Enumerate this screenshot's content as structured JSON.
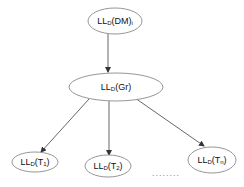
{
  "diagram": {
    "type": "tree",
    "nodes": [
      {
        "id": "root",
        "label_main": "LL",
        "label_sub": "D",
        "label_rest": "(DM)",
        "label_sub2": "i"
      },
      {
        "id": "mid",
        "label_main": "LL",
        "label_sub": "D",
        "label_rest": "(Gr)",
        "label_sub2": ""
      },
      {
        "id": "t1",
        "label_main": "LL",
        "label_sub": "D",
        "label_rest": "(T",
        "label_sub2": "1",
        "label_close": ")"
      },
      {
        "id": "t2",
        "label_main": "LL",
        "label_sub": "D",
        "label_rest": "(T",
        "label_sub2": "2",
        "label_close": ")"
      },
      {
        "id": "tn",
        "label_main": "LL",
        "label_sub": "D",
        "label_rest": "(T",
        "label_sub2": "n",
        "label_close": ")"
      }
    ],
    "edges": [
      {
        "from": "root",
        "to": "mid"
      },
      {
        "from": "mid",
        "to": "t1"
      },
      {
        "from": "mid",
        "to": "t2"
      },
      {
        "from": "mid",
        "to": "tn"
      }
    ],
    "ellipsis": "........"
  }
}
